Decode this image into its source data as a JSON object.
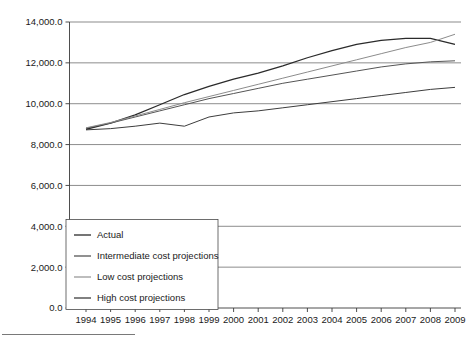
{
  "chart_data": {
    "type": "line",
    "title": "",
    "subtitle": "",
    "xlabel": "",
    "ylabel": "",
    "x": [
      1994,
      1995,
      1996,
      1997,
      1998,
      1999,
      2000,
      2001,
      2002,
      2003,
      2004,
      2005,
      2006,
      2007,
      2008,
      2009
    ],
    "xtick_labels": [
      "1994",
      "1995",
      "1996",
      "1997",
      "1998",
      "1999",
      "2000",
      "2001",
      "2002",
      "2003",
      "2004",
      "2005",
      "2006",
      "2007",
      "2008",
      "2009"
    ],
    "ytick_labels": [
      "0.0",
      "2,000.0",
      "4,000.0",
      "6,000.0",
      "8,000.0",
      "10,000.0",
      "12,000.0",
      "14,000.0"
    ],
    "ytick_values": [
      0,
      2000,
      4000,
      6000,
      8000,
      10000,
      12000,
      14000
    ],
    "ylim": [
      0,
      14000
    ],
    "xlim": [
      1994,
      2009
    ],
    "grid": "horizontal",
    "legend_position": "bottom-left-inside",
    "series": [
      {
        "name": "Actual",
        "color": "#2b2b2b",
        "width": 1.3,
        "values": [
          8750,
          9050,
          9450,
          9950,
          10450,
          10850,
          11200,
          11500,
          11850,
          12250,
          12600,
          12900,
          13100,
          13200,
          13200,
          12900
        ]
      },
      {
        "name": "Intermediate cost projections",
        "color": "#555555",
        "width": 1.0,
        "values": [
          8800,
          9050,
          9350,
          9650,
          9950,
          10250,
          10500,
          10750,
          11000,
          11200,
          11400,
          11600,
          11800,
          11950,
          12050,
          12100
        ]
      },
      {
        "name": "Low cost projections",
        "color": "#8c8c8c",
        "width": 1.0,
        "values": [
          8820,
          9080,
          9400,
          9720,
          10050,
          10350,
          10650,
          10950,
          11250,
          11550,
          11850,
          12150,
          12450,
          12750,
          13000,
          13400
        ]
      },
      {
        "name": "High cost projections",
        "color": "#3d3d3d",
        "width": 1.0,
        "values": [
          8720,
          8780,
          8900,
          9050,
          8900,
          9350,
          9550,
          9650,
          9800,
          9950,
          10100,
          10250,
          10400,
          10550,
          10700,
          10800
        ]
      }
    ]
  },
  "legend": {
    "items": [
      {
        "label": "Actual",
        "color": "#2b2b2b"
      },
      {
        "label": "Intermediate cost projections",
        "color": "#555555"
      },
      {
        "label": "Low cost projections",
        "color": "#9a9a9a"
      },
      {
        "label": "High cost projections",
        "color": "#3d3d3d"
      }
    ]
  }
}
